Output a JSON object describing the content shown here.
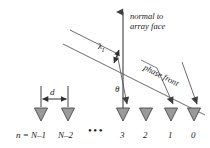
{
  "figure": {
    "name": "linear-array-phase-front-diagram",
    "width": 210,
    "height": 148,
    "background_color": "#ffffff",
    "line_color": "#3f3f3f",
    "element_fill_color": "#9a9a9a",
    "element_stroke_color": "#4a4a4a",
    "text_color": "#1a1a1a"
  },
  "annotations": {
    "normal_line_1": "normal to",
    "normal_line_2": "array face",
    "phase_front": "phase front",
    "wavelength_symbol": "λ",
    "wavelength_subscript": "I",
    "angle_symbol": "θ",
    "spacing_symbol": "d",
    "ellipsis": "•••"
  },
  "elements": {
    "labels": [
      {
        "id": "n-eq",
        "text": "n =",
        "x": 16,
        "y": 130
      },
      {
        "id": "n-minus-1",
        "text": "N–1",
        "x": 31,
        "y": 130
      },
      {
        "id": "n-minus-2",
        "text": "N–2",
        "x": 58,
        "y": 130
      },
      {
        "id": "elem-3",
        "text": "3",
        "x": 120,
        "y": 130
      },
      {
        "id": "elem-2",
        "text": "2",
        "x": 143,
        "y": 130
      },
      {
        "id": "elem-1",
        "text": "1",
        "x": 168,
        "y": 130
      },
      {
        "id": "elem-0",
        "text": "0",
        "x": 191,
        "y": 130
      }
    ],
    "marker_positions_x": [
      41,
      68,
      123,
      146,
      171,
      194
    ],
    "marker_top_y": 108,
    "marker_width": 13,
    "marker_height": 13
  },
  "geometry": {
    "normal_axis": {
      "x": 123,
      "y_top": 8,
      "y_bottom": 108
    },
    "phase_front_angle_deg": 26.5,
    "spacing_d_from_x": 41,
    "spacing_d_to_x": 68
  }
}
